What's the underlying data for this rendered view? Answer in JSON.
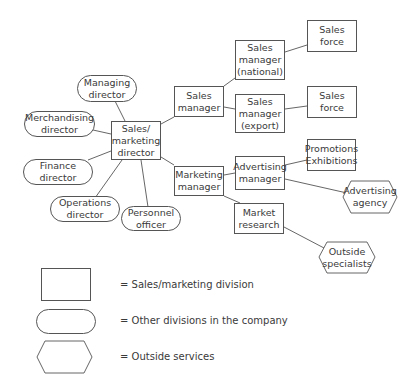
{
  "diagram": {
    "nodes": {
      "managing_director": "Managing\ndirector",
      "merchandising_director": "Merchandising\ndirector",
      "sales_marketing_director": "Sales/\nmarketing\ndirector",
      "finance_director": "Finance\ndirector",
      "operations_director": "Operations\ndirector",
      "personnel_officer": "Personnel\nofficer",
      "sales_manager": "Sales\nmanager",
      "sales_manager_national": "Sales\nmanager\n(national)",
      "sales_manager_export": "Sales\nmanager\n(export)",
      "sales_force_1": "Sales\nforce",
      "sales_force_2": "Sales\nforce",
      "marketing_manager": "Marketing\nmanager",
      "advertising_manager": "Advertising\nmanager",
      "promotions_exhibitions": "Promotions\nExhibitions",
      "advertising_agency": "Advertising\nagency",
      "market_research": "Market\nresearch",
      "outside_specialists": "Outside\nspecialists"
    },
    "legend": [
      {
        "shape": "rectangle",
        "label": "=   Sales/marketing division"
      },
      {
        "shape": "rounded",
        "label": "=   Other divisions in the company"
      },
      {
        "shape": "hexagon",
        "label": "=   Outside services"
      }
    ]
  }
}
